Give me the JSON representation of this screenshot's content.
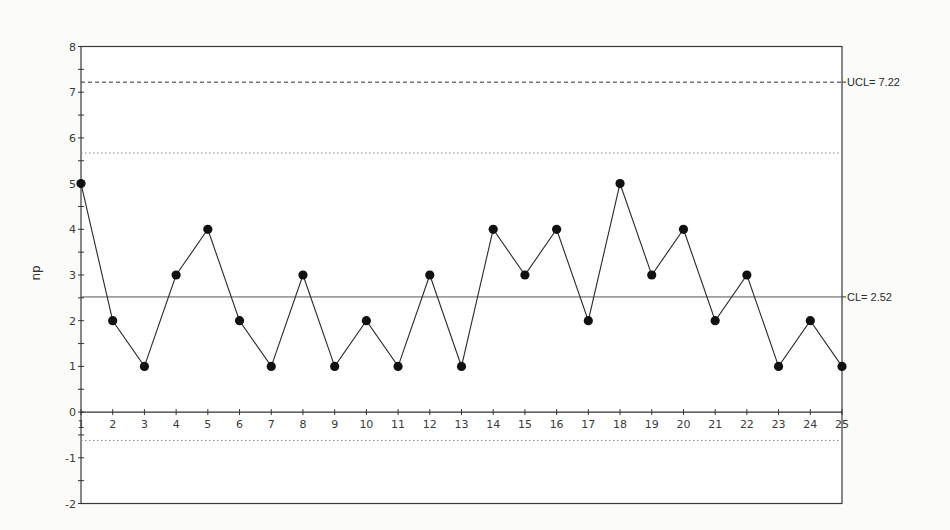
{
  "chart_data": {
    "type": "line",
    "title": "",
    "xlabel": "",
    "ylabel": "np",
    "x": [
      1,
      2,
      3,
      4,
      5,
      6,
      7,
      8,
      9,
      10,
      11,
      12,
      13,
      14,
      15,
      16,
      17,
      18,
      19,
      20,
      21,
      22,
      23,
      24,
      25
    ],
    "series": [
      {
        "name": "np",
        "values": [
          5,
          2,
          1,
          3,
          4,
          2,
          1,
          3,
          1,
          2,
          1,
          3,
          1,
          4,
          3,
          4,
          2,
          5,
          3,
          4,
          2,
          3,
          1,
          2,
          1
        ],
        "marker": "filled-circle",
        "color": "#1a1a1a"
      }
    ],
    "reference_lines": [
      {
        "name": "UCL",
        "value": 7.22,
        "label": "UCL= 7.22",
        "style": "dashed"
      },
      {
        "name": "upper-zone",
        "value": 5.67,
        "label": "",
        "style": "dotted"
      },
      {
        "name": "CL",
        "value": 2.52,
        "label": "CL= 2.52",
        "style": "solid"
      },
      {
        "name": "lower-zone",
        "value": -0.62,
        "label": "",
        "style": "dotted"
      }
    ],
    "xlim": [
      1,
      25
    ],
    "ylim": [
      -2,
      8
    ],
    "y_ticks": [
      -2,
      -1,
      0,
      1,
      2,
      3,
      4,
      5,
      6,
      7,
      8
    ],
    "x_ticks": [
      1,
      2,
      3,
      4,
      5,
      6,
      7,
      8,
      9,
      10,
      11,
      12,
      13,
      14,
      15,
      16,
      17,
      18,
      19,
      20,
      21,
      22,
      23,
      24,
      25
    ],
    "grid": false,
    "legend": "none"
  },
  "colors": {
    "line": "#2a2a2a",
    "marker": "#111111",
    "frame": "#3a3a3a",
    "dotted": "#8a8a8a"
  }
}
